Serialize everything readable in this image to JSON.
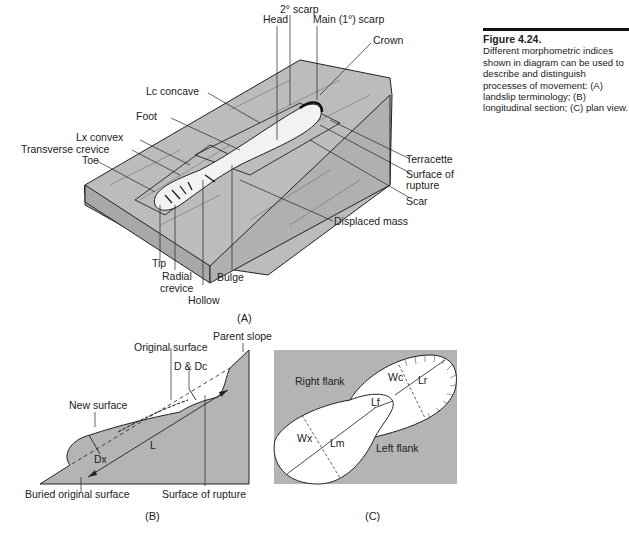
{
  "caption": {
    "title": "Figure 4.24.",
    "text": "Different morphometric indices shown in diagram can be used to describe and distinguish processes of movement: (A) landslip terminology; (B) longitudinal section; (C) plan view."
  },
  "panel_a": {
    "label": "(A)",
    "labels": {
      "scarp2": "2° scarp",
      "head": "Head",
      "main_scarp": "Main (1°) scarp",
      "crown": "Crown",
      "lc_concave": "Lc concave",
      "foot": "Foot",
      "lx_convex": "Lx convex",
      "transverse_crevice": "Transverse crevice",
      "toe": "Toe",
      "terracette": "Terracette",
      "surface_of_rupture_1": "Surface of",
      "surface_of_rupture_2": "rupture",
      "scar": "Scar",
      "displaced_mass": "Displaced mass",
      "tip": "Tip",
      "radial_crevice_1": "Radial",
      "radial_crevice_2": "crevice",
      "hollow": "Hollow",
      "bulge": "Bulge"
    }
  },
  "panel_b": {
    "label": "(B)",
    "labels": {
      "parent_slope": "Parent slope",
      "original_surface": "Original surface",
      "d_dc": "D & Dc",
      "new_surface": "New surface",
      "dx": "Dx",
      "l": "L",
      "buried_original_surface": "Buried original surface",
      "surface_of_rupture": "Surface of rupture"
    }
  },
  "panel_c": {
    "label": "(C)",
    "labels": {
      "right_flank": "Right flank",
      "left_flank": "Left flank",
      "wc": "Wc",
      "lr": "Lr",
      "lf": "Lf",
      "wx": "Wx",
      "lm": "Lm"
    }
  },
  "colors": {
    "fill_gray": "#b4b4b4",
    "side_gray": "#a8a8a8",
    "line": "#222222"
  }
}
